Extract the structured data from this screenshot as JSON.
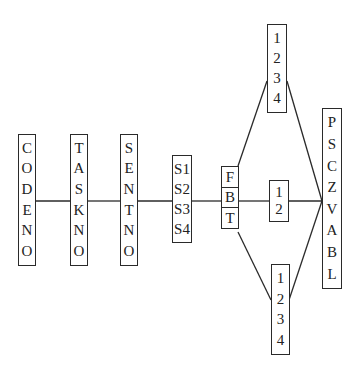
{
  "diagram": {
    "type": "tree / concatenated-field structure",
    "line_color": "#2a2a2a",
    "nodes": {
      "codeno": {
        "label": "CODENO",
        "chars": [
          "C",
          "O",
          "D",
          "E",
          "N",
          "O"
        ]
      },
      "taskno": {
        "label": "TASKNO",
        "chars": [
          "T",
          "A",
          "S",
          "K",
          "N",
          "O"
        ]
      },
      "sentno": {
        "label": "SENTNO",
        "chars": [
          "S",
          "E",
          "N",
          "T",
          "N",
          "O"
        ]
      },
      "s_group": {
        "chars": [
          "S1",
          "S2",
          "S3",
          "S4"
        ]
      },
      "fbt": {
        "chars": [
          "F",
          "B",
          "T"
        ]
      },
      "top_numbers": {
        "chars": [
          "1",
          "2",
          "3",
          "4"
        ]
      },
      "middle_numbers": {
        "chars": [
          "1",
          "2"
        ]
      },
      "bottom_numbers": {
        "chars": [
          "1",
          "2",
          "3",
          "4"
        ]
      },
      "pscz": {
        "label": "PSCZVABL",
        "chars": [
          "P",
          "S",
          "C",
          "Z",
          "V",
          "A",
          "B",
          "L"
        ]
      }
    },
    "edges": [
      [
        "codeno",
        "taskno"
      ],
      [
        "taskno",
        "sentno"
      ],
      [
        "sentno",
        "s_group"
      ],
      [
        "s_group",
        "fbt"
      ],
      [
        "fbt.F",
        "top_numbers"
      ],
      [
        "fbt.B",
        "middle_numbers"
      ],
      [
        "fbt.T",
        "bottom_numbers"
      ],
      [
        "top_numbers",
        "pscz"
      ],
      [
        "middle_numbers",
        "pscz"
      ],
      [
        "bottom_numbers",
        "pscz"
      ]
    ]
  }
}
